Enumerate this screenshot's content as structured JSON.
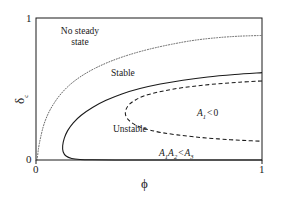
{
  "chart_data": {
    "type": "line",
    "title": "",
    "xlabel": "ϕ",
    "ylabel": "δ",
    "ylabel_sub": "c",
    "xlim": [
      0,
      1
    ],
    "ylim": [
      0,
      1
    ],
    "xticks": [
      "0",
      "1"
    ],
    "yticks": [
      "0",
      "1"
    ],
    "grid": false,
    "legend": "none",
    "series": [
      {
        "name": "no-steady-state-boundary",
        "style": "dotted",
        "color": "#555555",
        "points": [
          [
            0.005,
            0.0
          ],
          [
            0.012,
            0.09
          ],
          [
            0.022,
            0.17
          ],
          [
            0.035,
            0.25
          ],
          [
            0.055,
            0.33
          ],
          [
            0.08,
            0.4
          ],
          [
            0.11,
            0.465
          ],
          [
            0.15,
            0.53
          ],
          [
            0.2,
            0.59
          ],
          [
            0.26,
            0.645
          ],
          [
            0.33,
            0.695
          ],
          [
            0.41,
            0.74
          ],
          [
            0.5,
            0.78
          ],
          [
            0.6,
            0.815
          ],
          [
            0.7,
            0.843
          ],
          [
            0.8,
            0.861
          ],
          [
            0.9,
            0.872
          ],
          [
            1.0,
            0.877
          ]
        ]
      },
      {
        "name": "stable-unstable-boundary",
        "style": "solid",
        "color": "#1a1a1a",
        "points": [
          [
            1.0,
            0.615
          ],
          [
            0.88,
            0.602
          ],
          [
            0.76,
            0.585
          ],
          [
            0.65,
            0.562
          ],
          [
            0.55,
            0.535
          ],
          [
            0.46,
            0.503
          ],
          [
            0.38,
            0.465
          ],
          [
            0.31,
            0.42
          ],
          [
            0.25,
            0.37
          ],
          [
            0.2,
            0.315
          ],
          [
            0.165,
            0.262
          ],
          [
            0.14,
            0.207
          ],
          [
            0.125,
            0.152
          ],
          [
            0.118,
            0.1
          ],
          [
            0.12,
            0.058
          ],
          [
            0.133,
            0.028
          ],
          [
            0.158,
            0.011
          ],
          [
            0.195,
            0.004
          ],
          [
            0.25,
            0.0015
          ],
          [
            0.35,
            0.0005
          ],
          [
            0.5,
            0.0
          ],
          [
            0.7,
            0.0
          ],
          [
            1.0,
            0.0
          ]
        ]
      },
      {
        "name": "routh-hurwitz-boundary",
        "style": "dashed",
        "color": "#1a1a1a",
        "points": [
          [
            1.0,
            0.557
          ],
          [
            0.9,
            0.548
          ],
          [
            0.8,
            0.536
          ],
          [
            0.7,
            0.52
          ],
          [
            0.61,
            0.5
          ],
          [
            0.54,
            0.478
          ],
          [
            0.48,
            0.452
          ],
          [
            0.44,
            0.423
          ],
          [
            0.412,
            0.39
          ],
          [
            0.398,
            0.355
          ],
          [
            0.396,
            0.32
          ],
          [
            0.406,
            0.288
          ],
          [
            0.428,
            0.258
          ],
          [
            0.46,
            0.232
          ],
          [
            0.505,
            0.21
          ],
          [
            0.56,
            0.192
          ],
          [
            0.625,
            0.177
          ],
          [
            0.7,
            0.163
          ],
          [
            0.78,
            0.152
          ],
          [
            0.86,
            0.143
          ],
          [
            0.93,
            0.137
          ],
          [
            1.0,
            0.132
          ]
        ]
      }
    ],
    "annotations": [
      {
        "id": "no-steady-state",
        "text_line1": "No steady",
        "text_line2": "state",
        "x": 0.175,
        "y": 0.845
      },
      {
        "id": "stable",
        "text": "Stable",
        "x": 0.345,
        "y": 0.625
      },
      {
        "id": "unstable",
        "text": "Unstable",
        "x": 0.375,
        "y": 0.265
      },
      {
        "id": "a1-negative",
        "a": "A",
        "sub": "1",
        "op": "<",
        "rhs": "0",
        "x": 0.735,
        "y": 0.345
      },
      {
        "id": "routh-condition",
        "a1": "A",
        "sub1": "1",
        "a2": "A",
        "sub2": "2",
        "op": "<",
        "a3": "A",
        "sub3": "3",
        "x": 0.655,
        "y": 0.095
      }
    ]
  },
  "axes": {
    "x_tick_min": "0",
    "x_tick_max": "1",
    "y_tick_min": "0",
    "y_tick_max": "1",
    "x_title": "ϕ",
    "y_title_base": "δ",
    "y_title_sub": "c"
  },
  "labels": {
    "no_steady_state_line1": "No steady",
    "no_steady_state_line2": "state",
    "stable": "Stable",
    "unstable": "Unstable",
    "a1_symbol": "A",
    "a1_sub": "1",
    "a2_symbol": "A",
    "a2_sub": "2",
    "a3_symbol": "A",
    "a3_sub": "3",
    "lt": "<",
    "zero": "0"
  },
  "colors": {
    "frame": "#1a1a1a",
    "solid_curve": "#1a1a1a",
    "dashed_curve": "#1a1a1a",
    "dotted_curve": "#555555",
    "background": "#ffffff",
    "text": "#1a1a1a"
  }
}
